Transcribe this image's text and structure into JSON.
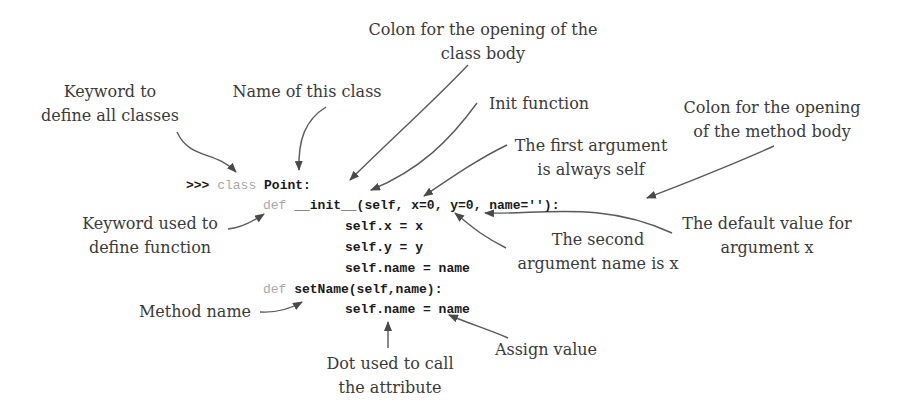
{
  "code": {
    "line1": {
      "prompt": ">>> ",
      "keyword": "class",
      "rest": " Point:"
    },
    "line2": {
      "keyword": "def",
      "rest": " __init__(self, x=0, y=0, name=''):"
    },
    "line3": "self.x = x",
    "line4": "self.y = y",
    "line5": "self.name = name",
    "line6": {
      "keyword": "def",
      "rest": " setName(self,name):"
    },
    "line7": "self.name = name"
  },
  "annotations": {
    "colon_class_body": "Colon for the opening of the\nclass body",
    "keyword_class": "Keyword to\ndefine all classes",
    "class_name": "Name of this class",
    "init_function": "Init function",
    "first_argument": "The first argument\nis always self",
    "colon_method_body": "Colon for the opening\nof the method body",
    "keyword_def": "Keyword used to\ndefine function",
    "default_value": "The default value for\nargument x",
    "second_argument": "The second\nargument name is x",
    "method_name": "Method name",
    "assign_value": "Assign value",
    "dot_attribute": "Dot used to call\nthe attribute"
  },
  "colors": {
    "text": "#3a3a3a",
    "code": "#1a1a1a",
    "keyword": "#a8a8a8",
    "arrow": "#555555"
  }
}
